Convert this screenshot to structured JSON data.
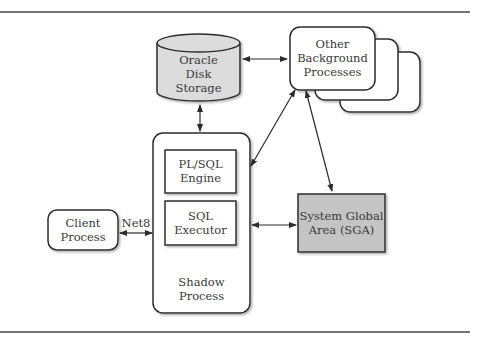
{
  "diagram": {
    "nodes": {
      "disk": {
        "line1": "Oracle",
        "line2": "Disk",
        "line3": "Storage"
      },
      "background": {
        "line1": "Other",
        "line2": "Background",
        "line3": "Processes"
      },
      "shadow": {
        "line1": "Shadow",
        "line2": "Process"
      },
      "plsql": {
        "line1": "PL/SQL",
        "line2": "Engine"
      },
      "sqlexec": {
        "line1": "SQL",
        "line2": "Executor"
      },
      "client": {
        "line1": "Client",
        "line2": "Process"
      },
      "sga": {
        "line1": "System Global",
        "line2": "Area (SGA)"
      }
    },
    "edges": {
      "net8_label": "Net8"
    },
    "colors": {
      "disk_fill": "#dcdcdc",
      "sga_fill": "#c4c4c4",
      "stroke": "#2b2b2b"
    }
  }
}
